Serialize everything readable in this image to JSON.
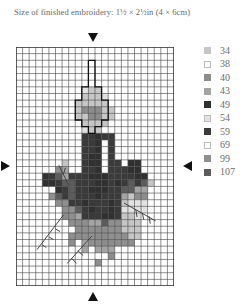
{
  "header": {
    "title": "Size of finished embroidery: 1½ × 2½in (4 × 6cm)"
  },
  "legend": {
    "items": [
      {
        "code": "34",
        "color": "#c6c6c6",
        "outline": false
      },
      {
        "code": "38",
        "color": "#ffffff",
        "outline": true
      },
      {
        "code": "40",
        "color": "#8c8c8c",
        "outline": false
      },
      {
        "code": "43",
        "color": "#a4a4a4",
        "outline": false
      },
      {
        "code": "49",
        "color": "#303030",
        "outline": false
      },
      {
        "code": "54",
        "color": "#e2e2e2",
        "outline": true
      },
      {
        "code": "59",
        "color": "#3a3a3a",
        "outline": false
      },
      {
        "code": "69",
        "color": "#ffffff",
        "outline": true
      },
      {
        "code": "99",
        "color": "#8f8f8f",
        "outline": false
      },
      {
        "code": "107",
        "color": "#5c5c5c",
        "outline": false
      }
    ]
  },
  "chart_data": {
    "type": "heatmap",
    "title": "Size of finished embroidery: 1½ × 2½in (4 × 6cm)",
    "columns": 24,
    "rows": 36,
    "center_markers": [
      "top",
      "bottom",
      "left",
      "right"
    ],
    "legend_codes": [
      "34",
      "38",
      "40",
      "43",
      "49",
      "54",
      "59",
      "69",
      "99",
      "107"
    ],
    "palette": {
      ".": "#ffffff",
      "a": "#c6c6c6",
      "b": "#8c8c8c",
      "c": "#a4a4a4",
      "d": "#303030",
      "e": "#e2e2e2",
      "f": "#3a3a3a",
      "g": "#8f8f8f",
      "h": "#5c5c5c"
    },
    "cells": [
      "........................",
      "........................",
      "............~...........",
      "...........~~...........",
      "...........~~...........",
      "...........~~...........",
      "..........eaa~..........",
      "..........aaae..........",
      ".........aaaaa~.........",
      ".........abbbaa.........",
      ".........aabbaa.........",
      "..........aaaa~.........",
      "..........eaa~..........",
      "..........ffdff.........",
      "..........ffd.f.........",
      "..........ffd.f.........",
      "..........fdd.f.........",
      ".......a..fdd.ff.dd.....",
      "......bc..ffd.fffdd.....",
      "....dfhcfffdddffffdd....",
      "....ddfhhfffddfdfhfha...",
      "......dfhffdddffhhcc....",
      ".....ghfhfffdfffcabb....",
      "......ggffdfffdfaeee....",
      ".......gghfdffdfeeee....",
      ".......bgcfffddfaae.....",
      "........gbgcchggaaa.....",
      ".........bggbbggaaa.....",
      "........gbggbbgggaa.....",
      "........g.cggbbggg......",
      "..........c.ccc.........",
      "..............b.........",
      "............g...........",
      "........................",
      "........................",
      "........................"
    ]
  }
}
